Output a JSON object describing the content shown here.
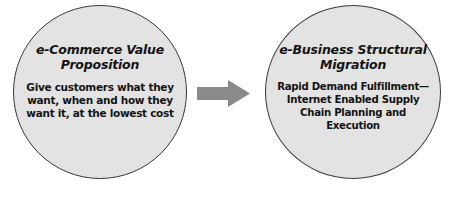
{
  "diagram": {
    "type": "two-node-flow",
    "background_color": "#ffffff",
    "nodes": [
      {
        "id": "ecommerce-value-proposition",
        "shape": "circle",
        "title": "e-Commerce Value Proposition",
        "title_lines": [
          "e-Commerce Value",
          "Proposition"
        ],
        "body": "Give customers what they want, when and how they want it, at the lowest cost",
        "body_lines": [
          "Give customers what",
          "they want, when and how",
          "they want it, at the",
          "lowest cost"
        ],
        "fill_color": "#e3e3e3",
        "border_color": "#3a3a3a"
      },
      {
        "id": "ebusiness-structural-migration",
        "shape": "circle",
        "title": "e-Business Structural Migration",
        "title_lines": [
          "e-Business",
          "Structural Migration"
        ],
        "body": "Rapid Demand Fulfillment—Internet Enabled Supply Chain Planning and Execution",
        "body_lines": [
          "Rapid Demand Fulfillment—",
          "Internet Enabled",
          "Supply Chain Planning",
          "and Execution"
        ],
        "fill_color": "#e3e3e3",
        "border_color": "#3a3a3a"
      }
    ],
    "connector": {
      "id": "left-to-right-arrow",
      "kind": "block-arrow",
      "direction": "right",
      "color": "#8a8a8a"
    }
  }
}
